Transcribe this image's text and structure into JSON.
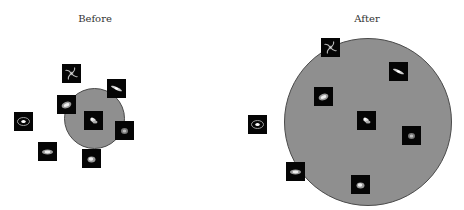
{
  "panels": [
    {
      "id": "before",
      "title": "Before",
      "title_x": 95,
      "circle": {
        "cx": 94.5,
        "cy": 118.5,
        "r": 30.5
      },
      "thumbs": [
        {
          "type": "spiral",
          "x": 62,
          "y": 64
        },
        {
          "type": "edge-on",
          "x": 107,
          "y": 79
        },
        {
          "type": "barred",
          "x": 57,
          "y": 95
        },
        {
          "type": "irregular",
          "x": 84,
          "y": 111
        },
        {
          "type": "ring",
          "x": 14,
          "y": 112
        },
        {
          "type": "elliptical",
          "x": 115,
          "y": 121
        },
        {
          "type": "lenticular",
          "x": 38,
          "y": 142
        },
        {
          "type": "compact",
          "x": 82,
          "y": 149
        }
      ]
    },
    {
      "id": "after",
      "title": "After",
      "title_x": 367,
      "circle": {
        "cx": 367.5,
        "cy": 122,
        "r": 84
      },
      "thumbs": [
        {
          "type": "spiral",
          "x": 321,
          "y": 38
        },
        {
          "type": "edge-on",
          "x": 389,
          "y": 62
        },
        {
          "type": "barred",
          "x": 314,
          "y": 87
        },
        {
          "type": "irregular",
          "x": 357,
          "y": 111
        },
        {
          "type": "ring",
          "x": 248,
          "y": 115
        },
        {
          "type": "elliptical",
          "x": 402,
          "y": 126
        },
        {
          "type": "lenticular",
          "x": 286,
          "y": 162
        },
        {
          "type": "compact",
          "x": 351,
          "y": 175
        }
      ]
    }
  ],
  "colors": {
    "circle_fill": "#8f8f8f",
    "circle_stroke": "#4a4a4a",
    "thumb_bg": "#050505",
    "title": "#333333"
  }
}
